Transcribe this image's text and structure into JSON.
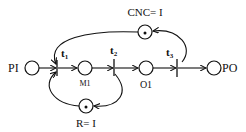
{
  "diagram": {
    "type": "petri-net",
    "places": [
      {
        "id": "PI",
        "label": "PI",
        "tokens": 0
      },
      {
        "id": "M1",
        "label": "M1",
        "tokens": 0
      },
      {
        "id": "O1",
        "label": "O1",
        "tokens": 0
      },
      {
        "id": "PO",
        "label": "PO",
        "tokens": 0
      },
      {
        "id": "CNC",
        "label": "CNC= I",
        "tokens": 1
      },
      {
        "id": "R",
        "label": "R= I",
        "tokens": 1
      }
    ],
    "transitions": [
      {
        "id": "t1",
        "label": "t",
        "subscript": "1"
      },
      {
        "id": "t2",
        "label": "t",
        "subscript": "2"
      },
      {
        "id": "t3",
        "label": "t",
        "subscript": "3"
      }
    ],
    "arcs": [
      [
        "PI",
        "t1"
      ],
      [
        "t1",
        "M1"
      ],
      [
        "M1",
        "t2"
      ],
      [
        "t2",
        "O1"
      ],
      [
        "O1",
        "t3"
      ],
      [
        "t3",
        "PO"
      ],
      [
        "t3",
        "CNC"
      ],
      [
        "CNC",
        "t1"
      ],
      [
        "t2",
        "R"
      ],
      [
        "R",
        "t1"
      ]
    ]
  }
}
